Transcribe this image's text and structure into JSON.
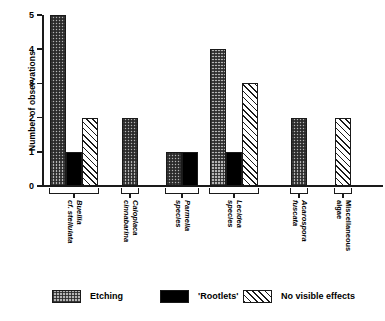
{
  "chart_data": {
    "type": "bar",
    "title": "",
    "xlabel": "",
    "ylabel": "Number of observations",
    "ylim": [
      0,
      5
    ],
    "yticks": [
      "0",
      "1",
      "2",
      "3",
      "4",
      "5"
    ],
    "grid": false,
    "legend_position": "bottom",
    "categories": [
      "Buellia cf. stellulata",
      "Caloplaca cinnabarina",
      "Parmelia species",
      "Lecidea species",
      "Acarospora fuscata",
      "Miscellaneous algae"
    ],
    "category_lines": [
      {
        "line1": "Buellia",
        "line2": "cf. stellulata",
        "italic": true
      },
      {
        "line1": "Caloplaca",
        "line2": "cinnabarina",
        "italic": true
      },
      {
        "line1": "Parmelia",
        "line2": "species",
        "italic": true
      },
      {
        "line1": "Lecidea",
        "line2": "species",
        "italic": true
      },
      {
        "line1": "Acarospora",
        "line2": "fuscata",
        "italic": true
      },
      {
        "line1": "Miscellaneous",
        "line2": "algae",
        "italic": false
      }
    ],
    "series": [
      {
        "name": "Etching",
        "pattern": "stipple-grey",
        "values": [
          5,
          2,
          1,
          4,
          2,
          0
        ]
      },
      {
        "name": "'Rootlets'",
        "pattern": "solid-black",
        "values": [
          1,
          0,
          1,
          1,
          0,
          0
        ]
      },
      {
        "name": "No visible effects",
        "pattern": "diagonal-hatch",
        "values": [
          2,
          0,
          0,
          3,
          0,
          2
        ]
      }
    ]
  },
  "legend": {
    "items": [
      {
        "label": "Etching"
      },
      {
        "label": "'Rootlets'"
      },
      {
        "label": "No visible effects"
      }
    ]
  },
  "colors": {
    "axis": "#1a1a1a",
    "etching_fill": "#b4b4b4",
    "rootlets_fill": "#000000",
    "novisible_fill": "#ffffff",
    "background": "#ffffff"
  }
}
